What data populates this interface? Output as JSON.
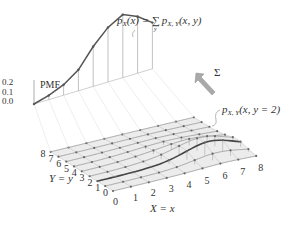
{
  "labels": {
    "pmf_axis": "PMF",
    "pmf_ticks": [
      "0.2",
      "0.1",
      "0.0"
    ],
    "marginal_formula": "p_X(x) = ∑_y p_{X,Y}(x, y)",
    "marginal_lhs": "p",
    "marginal_lhs_sub": "X",
    "marginal_lhs_arg": "(x) = ",
    "sum_symbol": "∑",
    "sum_sub": "y",
    "marginal_rhs": "p",
    "marginal_rhs_sub": "X, Y",
    "marginal_rhs_arg": "(x, y)",
    "sigma_arrow_label": "Σ",
    "slice_formula_p": "p",
    "slice_formula_sub": "X, Y",
    "slice_formula_arg": "(x, y = 2)",
    "y_axis_label": "Y = y",
    "x_axis_label": "X = x",
    "x_ticks": [
      "0",
      "1",
      "2",
      "3",
      "4",
      "5",
      "6",
      "7",
      "8"
    ],
    "y_ticks": [
      "0",
      "1",
      "2",
      "3",
      "4",
      "5",
      "6",
      "7",
      "8"
    ]
  },
  "colors": {
    "grid_line": "#9a9a9a",
    "surface_fill": "#ececec",
    "curve": "#555555",
    "arrow_fill": "#a9a9a9",
    "text": "#333333"
  },
  "chart_data": {
    "type": "surface",
    "xlabel": "X = x",
    "ylabel": "Y = y",
    "zlabel": "PMF",
    "z_ticks": [
      0.0,
      0.1,
      0.2
    ],
    "x": [
      0,
      1,
      2,
      3,
      4,
      5,
      6,
      7,
      8
    ],
    "y": [
      0,
      1,
      2,
      3,
      4,
      5,
      6,
      7,
      8
    ],
    "marginal_x_values": [
      0.0,
      0.02,
      0.05,
      0.1,
      0.19,
      0.26,
      0.3,
      0.27,
      0.22
    ],
    "highlighted_slice": "y = 2"
  }
}
